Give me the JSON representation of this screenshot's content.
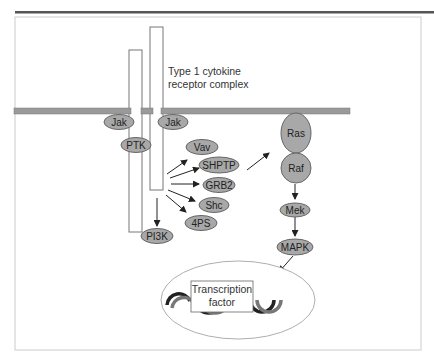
{
  "diagram": {
    "receptor_label_line1": "Type 1 cytokine",
    "receptor_label_line2": "receptor complex",
    "nodes": {
      "jak_left": "Jak",
      "jak_right": "Jak",
      "ptk": "PTK",
      "vav": "Vav",
      "shptp": "SHPTP",
      "grb2": "GRB2",
      "shc": "Shc",
      "fourps": "4PS",
      "pi3k": "PI3K",
      "ras": "Ras",
      "raf": "Raf",
      "mek": "Mek",
      "mapk": "MAPK"
    },
    "transcription_factor_line1": "Transcription",
    "transcription_factor_line2": "factor",
    "colors": {
      "node_fill": "#a8a8a8",
      "membrane": "#9a9a9a",
      "frame": "#cccccc",
      "rule": "#555555"
    }
  }
}
